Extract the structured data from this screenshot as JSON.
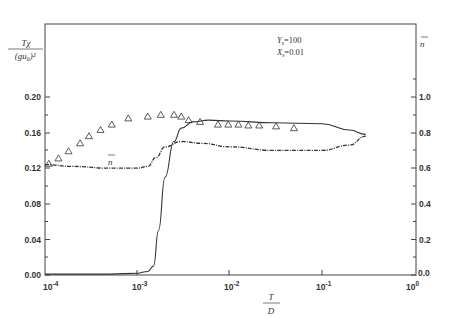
{
  "chart_data": {
    "type": "line",
    "title": "",
    "xlabel": "T / D",
    "ylabel_left": "Tχ / (gu_b)²",
    "ylabel_right": "n̄",
    "x_scale": "log",
    "xlim": [
      0.0001,
      1
    ],
    "ylim_left": [
      0.0,
      0.22
    ],
    "ylim_right": [
      0.0,
      1.1
    ],
    "x_ticks": [
      "10^-4",
      "10^-3",
      "10^-2",
      "10^-1",
      "10^0"
    ],
    "y_ticks_left": [
      "0.00",
      "0.04",
      "0.08",
      "0.12",
      "0.16",
      "0.20"
    ],
    "y_ticks_right": [
      "0.0",
      "0.2",
      "0.4",
      "0.6",
      "0.8",
      "1.0"
    ],
    "grid": false,
    "annotations": [
      "Y_s=100",
      "X_s=0.01",
      "n̄"
    ],
    "parameters": {
      "Ys": "100",
      "Xs": "0.01"
    },
    "series": [
      {
        "name": "Tχ/(gu_b)² (solid line)",
        "axis": "left",
        "style": "solid",
        "x": [
          0.0001,
          0.0005,
          0.001,
          0.0013,
          0.0015,
          0.0017,
          0.002,
          0.0025,
          0.003,
          0.004,
          0.006,
          0.01,
          0.03,
          0.1,
          0.2,
          0.3
        ],
        "y": [
          0.001,
          0.001,
          0.002,
          0.004,
          0.01,
          0.05,
          0.11,
          0.15,
          0.165,
          0.172,
          0.174,
          0.173,
          0.171,
          0.17,
          0.163,
          0.158
        ]
      },
      {
        "name": "n̄ (dash-dot line)",
        "axis": "right",
        "style": "dash-dot",
        "x": [
          0.0001,
          0.0002,
          0.0005,
          0.001,
          0.0013,
          0.0016,
          0.002,
          0.003,
          0.005,
          0.01,
          0.03,
          0.1,
          0.2,
          0.3
        ],
        "y": [
          0.62,
          0.61,
          0.6,
          0.6,
          0.61,
          0.66,
          0.72,
          0.75,
          0.74,
          0.72,
          0.7,
          0.7,
          0.73,
          0.78
        ]
      },
      {
        "name": "Tχ/(gu_b)² data (triangles)",
        "axis": "left",
        "style": "marker-triangle",
        "x": [
          0.00011,
          0.00014,
          0.00018,
          0.00024,
          0.0003,
          0.0004,
          0.00053,
          0.0008,
          0.0013,
          0.0018,
          0.0025,
          0.003,
          0.0036,
          0.0048,
          0.0075,
          0.0097,
          0.0125,
          0.016,
          0.021,
          0.032,
          0.05
        ],
        "y": [
          0.125,
          0.131,
          0.139,
          0.148,
          0.156,
          0.163,
          0.169,
          0.176,
          0.178,
          0.18,
          0.18,
          0.178,
          0.174,
          0.172,
          0.169,
          0.169,
          0.169,
          0.168,
          0.168,
          0.167,
          0.165
        ]
      }
    ]
  },
  "labels": {
    "y_left_num": "Tχ",
    "y_left_den": "(gu",
    "y_left_den_sub": "b",
    "y_left_den_end": ")²",
    "y_right": "n",
    "x_num": "T",
    "x_den": "D",
    "param_y": "Y",
    "param_y_sub": "s",
    "param_y_val": "=100",
    "param_x": "X",
    "param_x_sub": "s",
    "param_x_val": "=0.01",
    "curve_label": "n"
  },
  "ticks": {
    "left": [
      "0.00",
      "0.04",
      "0.08",
      "0.12",
      "0.16",
      "0.20"
    ],
    "right": [
      "0.0",
      "0.2",
      "0.4",
      "0.6",
      "0.8",
      "1.0"
    ],
    "x_base": [
      "10",
      "10",
      "10",
      "10",
      "10"
    ],
    "x_exp": [
      "-4",
      "-3",
      "-2",
      "-1",
      "0"
    ]
  },
  "colors": {
    "ink": "#333333",
    "background": "#ffffff"
  }
}
